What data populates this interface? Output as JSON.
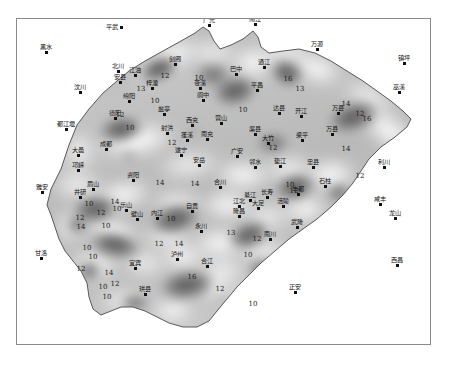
{
  "figure": {
    "title": "",
    "caption": "",
    "frame": {
      "border_color": "#8a8a8a",
      "background": "#ffffff"
    }
  },
  "chart_data": {
    "type": "heatmap",
    "title": "",
    "subtitle": "",
    "xlabel": "",
    "ylabel": "",
    "grid": false,
    "legend_position": "none",
    "colormap": "greyscale",
    "colormap_low": "#4a4a4a",
    "colormap_high": "#ffffff",
    "contour_interval": 2,
    "contour_levels": [
      10,
      12,
      13,
      14,
      16
    ],
    "contour_labels": [
      {
        "value": "12",
        "x": 103,
        "y": 96
      },
      {
        "value": "10",
        "x": 138,
        "y": 82
      },
      {
        "value": "12",
        "x": 148,
        "y": 57
      },
      {
        "value": "13",
        "x": 124,
        "y": 70
      },
      {
        "value": "10",
        "x": 182,
        "y": 59
      },
      {
        "value": "10",
        "x": 226,
        "y": 91
      },
      {
        "value": "16",
        "x": 271,
        "y": 60
      },
      {
        "value": "13",
        "x": 283,
        "y": 70
      },
      {
        "value": "14",
        "x": 329,
        "y": 85
      },
      {
        "value": "12",
        "x": 343,
        "y": 95
      },
      {
        "value": "16",
        "x": 350,
        "y": 100
      },
      {
        "value": "14",
        "x": 329,
        "y": 130
      },
      {
        "value": "12",
        "x": 343,
        "y": 157
      },
      {
        "value": "10",
        "x": 113,
        "y": 109
      },
      {
        "value": "12",
        "x": 155,
        "y": 124
      },
      {
        "value": "12",
        "x": 256,
        "y": 129
      },
      {
        "value": "10",
        "x": 273,
        "y": 166
      },
      {
        "value": "14",
        "x": 143,
        "y": 164
      },
      {
        "value": "14",
        "x": 178,
        "y": 165
      },
      {
        "value": "14",
        "x": 98,
        "y": 183
      },
      {
        "value": "10",
        "x": 72,
        "y": 185
      },
      {
        "value": "12",
        "x": 63,
        "y": 199
      },
      {
        "value": "14",
        "x": 64,
        "y": 208
      },
      {
        "value": "12",
        "x": 84,
        "y": 194
      },
      {
        "value": "10",
        "x": 89,
        "y": 207
      },
      {
        "value": "10",
        "x": 100,
        "y": 190
      },
      {
        "value": "10",
        "x": 70,
        "y": 229
      },
      {
        "value": "10",
        "x": 76,
        "y": 238
      },
      {
        "value": "12",
        "x": 64,
        "y": 250
      },
      {
        "value": "14",
        "x": 92,
        "y": 254
      },
      {
        "value": "12",
        "x": 98,
        "y": 265
      },
      {
        "value": "10",
        "x": 86,
        "y": 268
      },
      {
        "value": "10",
        "x": 90,
        "y": 278
      },
      {
        "value": "10",
        "x": 154,
        "y": 200
      },
      {
        "value": "12",
        "x": 142,
        "y": 225
      },
      {
        "value": "14",
        "x": 162,
        "y": 225
      },
      {
        "value": "16",
        "x": 175,
        "y": 258
      },
      {
        "value": "12",
        "x": 203,
        "y": 270
      },
      {
        "value": "13",
        "x": 214,
        "y": 214
      },
      {
        "value": "12",
        "x": 240,
        "y": 220
      },
      {
        "value": "10",
        "x": 231,
        "y": 236
      },
      {
        "value": "10",
        "x": 236,
        "y": 285
      },
      {
        "value": "12",
        "x": 277,
        "y": 172
      }
    ],
    "cities_inside": [
      {
        "name": "江油",
        "x": 118,
        "y": 56,
        "anchor": "top"
      },
      {
        "name": "安县",
        "x": 103,
        "y": 63,
        "anchor": "top"
      },
      {
        "name": "北川",
        "x": 101,
        "y": 52,
        "anchor": "top"
      },
      {
        "name": "梓潼",
        "x": 135,
        "y": 69,
        "anchor": "top"
      },
      {
        "name": "绵阳",
        "x": 112,
        "y": 82,
        "anchor": "top"
      },
      {
        "name": "德阳",
        "x": 98,
        "y": 99,
        "anchor": "top"
      },
      {
        "name": "剑阁",
        "x": 158,
        "y": 45,
        "anchor": "top"
      },
      {
        "name": "盐亭",
        "x": 147,
        "y": 95,
        "anchor": "top"
      },
      {
        "name": "苍溪",
        "x": 183,
        "y": 69,
        "anchor": "top"
      },
      {
        "name": "阆中",
        "x": 186,
        "y": 81,
        "anchor": "top"
      },
      {
        "name": "巴中",
        "x": 219,
        "y": 55,
        "anchor": "top"
      },
      {
        "name": "通江",
        "x": 247,
        "y": 48,
        "anchor": "top"
      },
      {
        "name": "平昌",
        "x": 240,
        "y": 71,
        "anchor": "top"
      },
      {
        "name": "达县",
        "x": 262,
        "y": 94,
        "anchor": "top"
      },
      {
        "name": "开江",
        "x": 284,
        "y": 97,
        "anchor": "top"
      },
      {
        "name": "万县",
        "x": 321,
        "y": 94,
        "anchor": "top"
      },
      {
        "name": "梁平",
        "x": 285,
        "y": 121,
        "anchor": "top"
      },
      {
        "name": "万县",
        "x": 315,
        "y": 115,
        "anchor": "top"
      },
      {
        "name": "西充",
        "x": 175,
        "y": 106,
        "anchor": "top"
      },
      {
        "name": "营山",
        "x": 204,
        "y": 104,
        "anchor": "top"
      },
      {
        "name": "射洪",
        "x": 150,
        "y": 114,
        "anchor": "top"
      },
      {
        "name": "蓬溪",
        "x": 170,
        "y": 121,
        "anchor": "top"
      },
      {
        "name": "南充",
        "x": 190,
        "y": 120,
        "anchor": "top"
      },
      {
        "name": "渠县",
        "x": 238,
        "y": 115,
        "anchor": "top"
      },
      {
        "name": "大竹",
        "x": 251,
        "y": 124,
        "anchor": "top"
      },
      {
        "name": "遂宁",
        "x": 164,
        "y": 136,
        "anchor": "top"
      },
      {
        "name": "安岳",
        "x": 182,
        "y": 146,
        "anchor": "top"
      },
      {
        "name": "广安",
        "x": 220,
        "y": 137,
        "anchor": "top"
      },
      {
        "name": "邻水",
        "x": 238,
        "y": 148,
        "anchor": "top"
      },
      {
        "name": "垫江",
        "x": 263,
        "y": 147,
        "anchor": "top"
      },
      {
        "name": "忠县",
        "x": 296,
        "y": 148,
        "anchor": "top"
      },
      {
        "name": "石柱",
        "x": 308,
        "y": 167,
        "anchor": "top"
      },
      {
        "name": "丰都",
        "x": 281,
        "y": 175,
        "anchor": "top"
      },
      {
        "name": "长寿",
        "x": 250,
        "y": 178,
        "anchor": "top"
      },
      {
        "name": "涪陵",
        "x": 266,
        "y": 187,
        "anchor": "top"
      },
      {
        "name": "江北",
        "x": 222,
        "y": 187,
        "anchor": "top"
      },
      {
        "name": "合川",
        "x": 203,
        "y": 168,
        "anchor": "top"
      },
      {
        "name": "大足",
        "x": 241,
        "y": 189,
        "anchor": "top"
      },
      {
        "name": "壁山",
        "x": 120,
        "y": 200,
        "anchor": "top"
      },
      {
        "name": "内江",
        "x": 140,
        "y": 199,
        "anchor": "top"
      },
      {
        "name": "资阳",
        "x": 116,
        "y": 161,
        "anchor": "top"
      },
      {
        "name": "成都",
        "x": 89,
        "y": 130,
        "anchor": "top"
      },
      {
        "name": "大邑",
        "x": 61,
        "y": 136,
        "anchor": "top"
      },
      {
        "name": "邛崃",
        "x": 61,
        "y": 151,
        "anchor": "top"
      },
      {
        "name": "眉山",
        "x": 76,
        "y": 170,
        "anchor": "top"
      },
      {
        "name": "井研",
        "x": 63,
        "y": 178,
        "anchor": "top"
      },
      {
        "name": "乐山",
        "x": 109,
        "y": 191,
        "anchor": "top"
      },
      {
        "name": "自贡",
        "x": 175,
        "y": 192,
        "anchor": "top"
      },
      {
        "name": "永川",
        "x": 184,
        "y": 212,
        "anchor": "top"
      },
      {
        "name": "隆昌",
        "x": 222,
        "y": 197,
        "anchor": "top"
      },
      {
        "name": "泸州",
        "x": 160,
        "y": 240,
        "anchor": "top"
      },
      {
        "name": "合江",
        "x": 190,
        "y": 247,
        "anchor": "top"
      },
      {
        "name": "宜宾",
        "x": 118,
        "y": 249,
        "anchor": "top"
      },
      {
        "name": "珙县",
        "x": 128,
        "y": 275,
        "anchor": "top"
      },
      {
        "name": "南川",
        "x": 253,
        "y": 220,
        "anchor": "top"
      },
      {
        "name": "武隆",
        "x": 280,
        "y": 208,
        "anchor": "top"
      },
      {
        "name": "綦江",
        "x": 233,
        "y": 181,
        "anchor": "top"
      }
    ],
    "cities_outside": [
      {
        "name": "平武",
        "x": 104,
        "y": 8,
        "anchor": "right"
      },
      {
        "name": "黑水",
        "x": 29,
        "y": 33,
        "anchor": "top"
      },
      {
        "name": "汶川",
        "x": 63,
        "y": 73,
        "anchor": "top"
      },
      {
        "name": "都江堰",
        "x": 49,
        "y": 110,
        "anchor": "top"
      },
      {
        "name": "雅安",
        "x": 25,
        "y": 173,
        "anchor": "top"
      },
      {
        "name": "甘洛",
        "x": 24,
        "y": 239,
        "anchor": "top"
      },
      {
        "name": "广元",
        "x": 192,
        "y": 6,
        "anchor": "top"
      },
      {
        "name": "南江",
        "x": 238,
        "y": 5,
        "anchor": "top"
      },
      {
        "name": "万源",
        "x": 300,
        "y": 30,
        "anchor": "top"
      },
      {
        "name": "镇坪",
        "x": 387,
        "y": 44,
        "anchor": "top"
      },
      {
        "name": "巫溪",
        "x": 382,
        "y": 73,
        "anchor": "top"
      },
      {
        "name": "利川",
        "x": 367,
        "y": 148,
        "anchor": "top"
      },
      {
        "name": "咸丰",
        "x": 363,
        "y": 185,
        "anchor": "top"
      },
      {
        "name": "龙山",
        "x": 378,
        "y": 199,
        "anchor": "top"
      },
      {
        "name": "西昌",
        "x": 380,
        "y": 246,
        "anchor": "top"
      },
      {
        "name": "正安",
        "x": 278,
        "y": 273,
        "anchor": "top"
      }
    ]
  }
}
